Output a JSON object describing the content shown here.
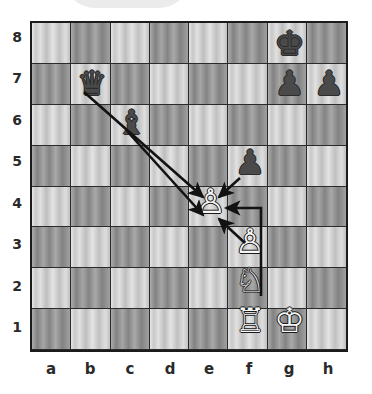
{
  "diagram": {
    "orientation": "white-bottom",
    "board": {
      "files": [
        "a",
        "b",
        "c",
        "d",
        "e",
        "f",
        "g",
        "h"
      ],
      "ranks": [
        "8",
        "7",
        "6",
        "5",
        "4",
        "3",
        "2",
        "1"
      ],
      "light_square_color": "#c8c8c8",
      "dark_square_color": "#8c8c8c",
      "border_color": "#1b1b1b"
    },
    "pieces": [
      {
        "id": "black-king-g8",
        "square": "g8",
        "file": "g",
        "rank": "8",
        "color": "black",
        "type": "king",
        "glyph": "♚"
      },
      {
        "id": "black-queen-b7",
        "square": "b7",
        "file": "b",
        "rank": "7",
        "color": "black",
        "type": "queen",
        "glyph": "♛"
      },
      {
        "id": "black-pawn-g7",
        "square": "g7",
        "file": "g",
        "rank": "7",
        "color": "black",
        "type": "pawn",
        "glyph": "♟"
      },
      {
        "id": "black-pawn-h7",
        "square": "h7",
        "file": "h",
        "rank": "7",
        "color": "black",
        "type": "pawn",
        "glyph": "♟"
      },
      {
        "id": "black-bishop-c6",
        "square": "c6",
        "file": "c",
        "rank": "6",
        "color": "black",
        "type": "bishop",
        "glyph": "♝"
      },
      {
        "id": "black-pawn-f5",
        "square": "f5",
        "file": "f",
        "rank": "5",
        "color": "black",
        "type": "pawn",
        "glyph": "♟"
      },
      {
        "id": "white-pawn-e4",
        "square": "e4",
        "file": "e",
        "rank": "4",
        "color": "white",
        "type": "pawn",
        "glyph": "♙"
      },
      {
        "id": "white-pawn-f3",
        "square": "f3",
        "file": "f",
        "rank": "3",
        "color": "white",
        "type": "pawn",
        "glyph": "♙"
      },
      {
        "id": "white-knight-f2",
        "square": "f2",
        "file": "f",
        "rank": "2",
        "color": "white",
        "type": "knight",
        "glyph": "♘"
      },
      {
        "id": "white-rook-f1",
        "square": "f1",
        "file": "f",
        "rank": "1",
        "color": "white",
        "type": "rook",
        "glyph": "♖"
      },
      {
        "id": "white-king-g1",
        "square": "g1",
        "file": "g",
        "rank": "1",
        "color": "white",
        "type": "king",
        "glyph": "♔"
      }
    ],
    "arrows": [
      {
        "id": "arrow-queen-b7-e4",
        "from": "b7",
        "to": "e4",
        "kind": "straight",
        "color": "#121212"
      },
      {
        "id": "arrow-bishop-c6-e4",
        "from": "c6",
        "to": "e4",
        "kind": "straight",
        "color": "#121212"
      },
      {
        "id": "arrow-pawn-f5-e4",
        "from": "f5",
        "to": "e4",
        "kind": "straight",
        "color": "#121212"
      },
      {
        "id": "arrow-pawn-f3-e4",
        "from": "f3",
        "to": "e4",
        "kind": "straight",
        "color": "#121212"
      },
      {
        "id": "arrow-knight-f2-e4",
        "from": "f2",
        "to": "e4",
        "kind": "elbow",
        "color": "#121212"
      }
    ],
    "watermark": {
      "name": "page-watermark",
      "color": "#e8e8e8"
    }
  }
}
